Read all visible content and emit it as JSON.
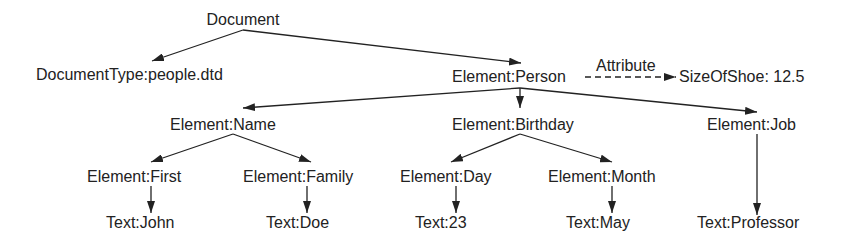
{
  "diagram": {
    "nodes": {
      "document": "Document",
      "doctype": "DocumentType:people.dtd",
      "person": "Element:Person",
      "attribute_value": "SizeOfShoe: 12.5",
      "name": "Element:Name",
      "birthday": "Element:Birthday",
      "job": "Element:Job",
      "first": "Element:First",
      "family": "Element:Family",
      "day": "Element:Day",
      "month": "Element:Month",
      "text_john": "Text:John",
      "text_doe": "Text:Doe",
      "text_23": "Text:23",
      "text_may": "Text:May",
      "text_professor": "Text:Professor"
    },
    "edge_labels": {
      "attribute": "Attribute"
    },
    "edges": [
      {
        "from": "Document",
        "to": "DocumentType:people.dtd",
        "style": "solid"
      },
      {
        "from": "Document",
        "to": "Element:Person",
        "style": "solid"
      },
      {
        "from": "Element:Person",
        "to": "SizeOfShoe: 12.5",
        "style": "dashed",
        "label": "Attribute"
      },
      {
        "from": "Element:Person",
        "to": "Element:Name",
        "style": "solid"
      },
      {
        "from": "Element:Person",
        "to": "Element:Birthday",
        "style": "solid"
      },
      {
        "from": "Element:Person",
        "to": "Element:Job",
        "style": "solid"
      },
      {
        "from": "Element:Name",
        "to": "Element:First",
        "style": "solid"
      },
      {
        "from": "Element:Name",
        "to": "Element:Family",
        "style": "solid"
      },
      {
        "from": "Element:Birthday",
        "to": "Element:Day",
        "style": "solid"
      },
      {
        "from": "Element:Birthday",
        "to": "Element:Month",
        "style": "solid"
      },
      {
        "from": "Element:First",
        "to": "Text:John",
        "style": "solid"
      },
      {
        "from": "Element:Family",
        "to": "Text:Doe",
        "style": "solid"
      },
      {
        "from": "Element:Day",
        "to": "Text:23",
        "style": "solid"
      },
      {
        "from": "Element:Month",
        "to": "Text:May",
        "style": "solid"
      },
      {
        "from": "Element:Job",
        "to": "Text:Professor",
        "style": "solid"
      }
    ],
    "colors": {
      "ink": "#222222",
      "background": "#ffffff"
    }
  }
}
